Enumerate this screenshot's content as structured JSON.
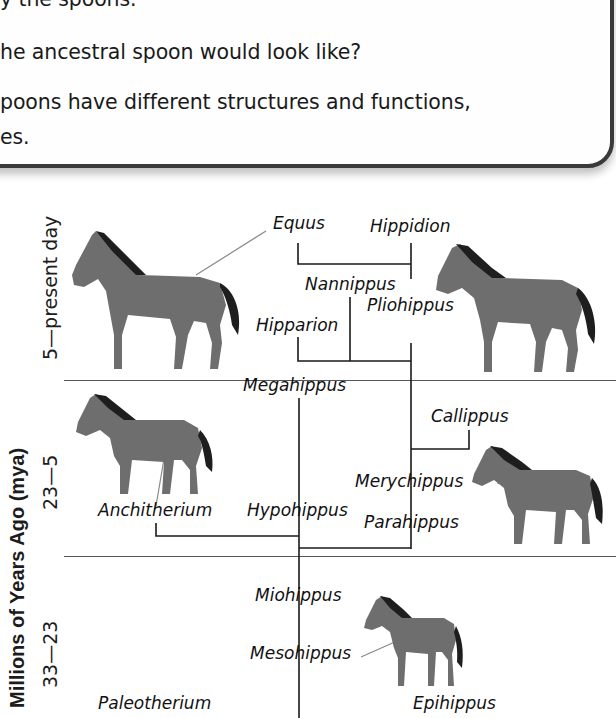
{
  "question_box": {
    "lines": [
      "y the spoons.",
      "he ancestral spoon would look like?",
      "poons have different structures and functions,",
      "es."
    ]
  },
  "axis": {
    "title": "Millions of Years Ago (mya)",
    "periods": [
      {
        "label": "5—present day"
      },
      {
        "label": "23—5"
      },
      {
        "label": "33—23"
      }
    ]
  },
  "taxa": {
    "equus": "Equus",
    "hippidion": "Hippidion",
    "nannippus": "Nannippus",
    "pliohippus": "Pliohippus",
    "hipparion": "Hipparion",
    "megahippus": "Megahippus",
    "callippus": "Callippus",
    "merychippus": "Merychippus",
    "anchitherium": "Anchitherium",
    "hypohippus": "Hypohippus",
    "parahippus": "Parahippus",
    "miohippus": "Miohippus",
    "mesohippus": "Mesohippus",
    "paleotherium": "Paleotherium",
    "epihippus": "Epihippus"
  },
  "illustrations": [
    {
      "name": "Equus",
      "icon": "horse-icon"
    },
    {
      "name": "Pliohippus",
      "icon": "horse-icon"
    },
    {
      "name": "Anchitherium",
      "icon": "horse-icon"
    },
    {
      "name": "Merychippus",
      "icon": "horse-icon"
    },
    {
      "name": "Mesohippus",
      "icon": "horse-icon"
    }
  ],
  "colors": {
    "line": "#1a1a1a",
    "horse_body": "#6e6e6e",
    "horse_mane": "#1e1e1e",
    "box_border": "#3a3a3a"
  }
}
